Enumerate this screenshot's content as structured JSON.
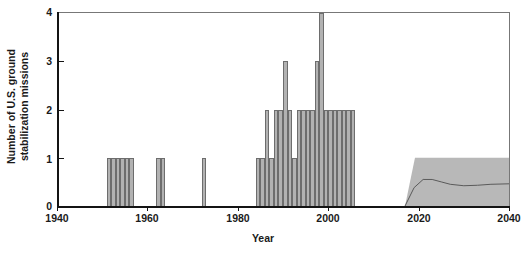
{
  "chart_data": {
    "type": "bar",
    "title": "",
    "xlabel": "Year",
    "ylabel": "Number of U.S. ground stabilization missions",
    "xlim": [
      1940,
      2040
    ],
    "ylim": [
      0,
      4
    ],
    "xticks": [
      1940,
      1960,
      1980,
      2000,
      2020,
      2040
    ],
    "yticks": [
      0,
      1,
      2,
      3,
      4
    ],
    "grid": false,
    "legend": "none",
    "bar_color": "#b2b2b2",
    "bar_edge_color": "#6d6d6d",
    "band_color": "#b8b8b8",
    "axis_color": "#141414",
    "categories": [
      1951,
      1952,
      1953,
      1954,
      1955,
      1956,
      1962,
      1963,
      1972,
      1984,
      1985,
      1986,
      1987,
      1988,
      1989,
      1990,
      1991,
      1992,
      1993,
      1994,
      1995,
      1996,
      1997,
      1998,
      1999,
      2000,
      2001,
      2002,
      2003,
      2004,
      2005
    ],
    "values": [
      1,
      1,
      1,
      1,
      1,
      1,
      1,
      1,
      1,
      1,
      1,
      2,
      1,
      2,
      2,
      3,
      2,
      1,
      2,
      2,
      2,
      2,
      3,
      4,
      2,
      2,
      2,
      2,
      2,
      2,
      2
    ],
    "projection": {
      "label": "projected range",
      "start_year": 2017,
      "end_year": 2040,
      "band_top": 1.0,
      "band_bottom": 0.0,
      "trend_x": [
        2017,
        2019,
        2021,
        2023,
        2025,
        2027,
        2030,
        2033,
        2036,
        2040
      ],
      "trend_y": [
        0.0,
        0.38,
        0.55,
        0.55,
        0.5,
        0.45,
        0.42,
        0.43,
        0.45,
        0.46
      ]
    }
  },
  "axis": {
    "y_title_line1": "Number of U.S. ground",
    "y_title_line2": "stabilization missions",
    "x_title": "Year",
    "y_tick_0": "0",
    "y_tick_1": "1",
    "y_tick_2": "2",
    "y_tick_3": "3",
    "y_tick_4": "4",
    "x_tick_1940": "1940",
    "x_tick_1960": "1960",
    "x_tick_1980": "1980",
    "x_tick_2000": "2000",
    "x_tick_2020": "2020",
    "x_tick_2040": "2040"
  }
}
